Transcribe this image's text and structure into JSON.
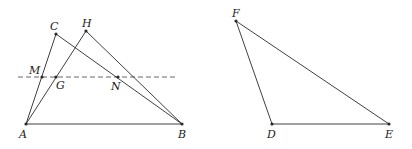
{
  "figure": {
    "stroke_color": "#2a2a2a",
    "dash_color": "#555555",
    "left_diagram": {
      "points": {
        "A": {
          "label": "A",
          "x": 26,
          "y": 124,
          "lx": 19,
          "ly": 138
        },
        "B": {
          "label": "B",
          "x": 182,
          "y": 124,
          "lx": 178,
          "ly": 138
        },
        "C": {
          "label": "C",
          "x": 56,
          "y": 34,
          "lx": 50,
          "ly": 30
        },
        "H": {
          "label": "H",
          "x": 86,
          "y": 31,
          "lx": 82,
          "ly": 27
        },
        "M": {
          "label": "M",
          "x": 42,
          "y": 77,
          "lx": 29,
          "ly": 74
        },
        "G": {
          "label": "G",
          "x": 56,
          "y": 77,
          "lx": 56,
          "ly": 89
        },
        "N": {
          "label": "N",
          "x": 118,
          "y": 77,
          "lx": 111,
          "ly": 90
        }
      },
      "segments": [
        [
          "A",
          "B"
        ],
        [
          "A",
          "C"
        ],
        [
          "C",
          "B"
        ],
        [
          "A",
          "H"
        ],
        [
          "H",
          "B"
        ]
      ],
      "dashed_line": {
        "x1": 18,
        "y1": 77,
        "x2": 177,
        "y2": 77
      }
    },
    "right_diagram": {
      "points": {
        "F": {
          "label": "F",
          "x": 236,
          "y": 21,
          "lx": 232,
          "ly": 17
        },
        "D": {
          "label": "D",
          "x": 272,
          "y": 124,
          "lx": 267,
          "ly": 138
        },
        "E": {
          "label": "E",
          "x": 389,
          "y": 124,
          "lx": 385,
          "ly": 138
        }
      },
      "segments": [
        [
          "F",
          "D"
        ],
        [
          "D",
          "E"
        ],
        [
          "F",
          "E"
        ]
      ]
    }
  }
}
